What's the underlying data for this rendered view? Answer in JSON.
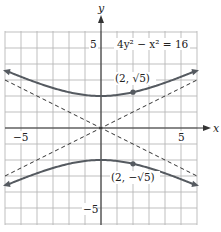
{
  "chart_data": {
    "type": "line",
    "title": "",
    "equation_label": "4y² − x² = 16",
    "xlabel": "x",
    "ylabel": "y",
    "xlim": [
      -6,
      6
    ],
    "ylim": [
      -6,
      6
    ],
    "grid": true,
    "x_tick_labels": [
      {
        "value": -5,
        "text": "−5"
      },
      {
        "value": 5,
        "text": "5"
      }
    ],
    "y_tick_labels": [
      {
        "value": 5,
        "text": "5"
      },
      {
        "value": -5,
        "text": "−5"
      }
    ],
    "series": [
      {
        "name": "upper branch",
        "style": "solid",
        "function": "y = sqrt(4 + x^2/4)",
        "x": [
          -6,
          -4,
          -2,
          0,
          2,
          4,
          6
        ],
        "y": [
          3.606,
          2.828,
          2.236,
          2.0,
          2.236,
          2.828,
          3.606
        ]
      },
      {
        "name": "lower branch",
        "style": "solid",
        "function": "y = -sqrt(4 + x^2/4)",
        "x": [
          -6,
          -4,
          -2,
          0,
          2,
          4,
          6
        ],
        "y": [
          -3.606,
          -2.828,
          -2.236,
          -2.0,
          -2.236,
          -2.828,
          -3.606
        ]
      },
      {
        "name": "asymptote y = x/2",
        "style": "dashed",
        "x": [
          -6,
          6
        ],
        "y": [
          -3,
          3
        ]
      },
      {
        "name": "asymptote y = -x/2",
        "style": "dashed",
        "x": [
          -6,
          6
        ],
        "y": [
          3,
          -3
        ]
      }
    ],
    "points": [
      {
        "x": 2,
        "y": 2.236,
        "label": "(2, √5)"
      },
      {
        "x": 2,
        "y": -2.236,
        "label": "(2, −√5)"
      }
    ]
  },
  "labels": {
    "x_axis": "x",
    "y_axis": "y",
    "equation": "4y² − x² = 16",
    "tick_x_neg5": "−5",
    "tick_x_pos5": "5",
    "tick_y_pos5": "5",
    "tick_y_neg5": "−5",
    "point_upper": "(2, √5)",
    "point_lower": "(2, −√5)"
  },
  "colors": {
    "curve": "#555a60",
    "grid": "#b8b8b8",
    "axis": "#333333"
  }
}
